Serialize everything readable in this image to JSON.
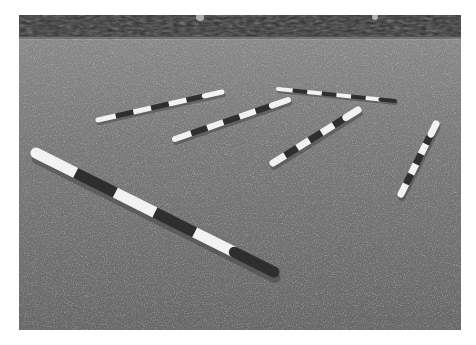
{
  "image": {
    "description": "Grayscale photograph of five black-and-white striped wooden ground poles laid on a dry grass field with a dark treeline along the horizon",
    "palette": {
      "background": "#ffffff",
      "trees": "#2a2a2a",
      "grass_far": "#8a8a8a",
      "grass_near": "#6e6e6e",
      "pole_white": "#f2f2f2",
      "pole_dark": "#2e2e2e"
    },
    "poles": [
      {
        "id": "front-left-long",
        "x1": 36,
        "y1": 153,
        "x2": 274,
        "y2": 272,
        "width": 11,
        "stripes": 6
      },
      {
        "id": "back-left",
        "x1": 98,
        "y1": 120,
        "x2": 222,
        "y2": 92,
        "width": 5,
        "stripes": 7
      },
      {
        "id": "middle-left",
        "x1": 175,
        "y1": 139,
        "x2": 288,
        "y2": 100,
        "width": 6,
        "stripes": 7
      },
      {
        "id": "back-right",
        "x1": 278,
        "y1": 89,
        "x2": 395,
        "y2": 101,
        "width": 4,
        "stripes": 8
      },
      {
        "id": "middle-right",
        "x1": 273,
        "y1": 163,
        "x2": 358,
        "y2": 110,
        "width": 7,
        "stripes": 7
      },
      {
        "id": "far-right",
        "x1": 401,
        "y1": 194,
        "x2": 436,
        "y2": 124,
        "width": 7,
        "stripes": 7
      }
    ]
  }
}
